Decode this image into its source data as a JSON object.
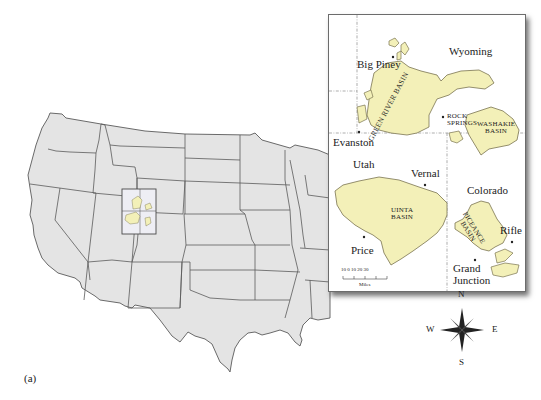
{
  "figure": {
    "label": "(a)",
    "colors": {
      "land": "#e4e4e4",
      "state_border": "#5a5a5a",
      "basin_fill": "#f3f0b8",
      "basin_border": "#6e6a45",
      "inset_border": "#6c6c6c",
      "text": "#222222"
    }
  },
  "inset": {
    "states": [
      "Wyoming",
      "Utah",
      "Colorado"
    ],
    "basins": [
      {
        "name": "GREEN RIVER BASIN"
      },
      {
        "name": "WASHAKIE BASIN",
        "line1": "WASHAKIE",
        "line2": "BASIN"
      },
      {
        "name": "UINTA BASIN",
        "line1": "UINTA",
        "line2": "BASIN"
      },
      {
        "name": "PICEANCE BASIN",
        "line1": "PICEANCE",
        "line2": "BASIN"
      }
    ],
    "cities": [
      {
        "name": "Big Piney"
      },
      {
        "name": "Evanston"
      },
      {
        "name": "ROCK",
        "line2": "SPRINGS"
      },
      {
        "name": "Vernal"
      },
      {
        "name": "Price"
      },
      {
        "name": "Rifle"
      },
      {
        "name": "Grand",
        "line2": "Junction"
      }
    ],
    "scale": {
      "ticks": "10  0  10  20  30",
      "unit": "Miles"
    }
  },
  "compass": {
    "n": "N",
    "s": "S",
    "e": "E",
    "w": "W"
  }
}
